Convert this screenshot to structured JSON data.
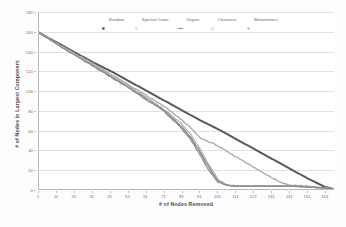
{
  "chart_data": {
    "type": "line",
    "title": "",
    "xlabel": "# of Nodes Removed",
    "ylabel": "# of Nodes in Largest Component",
    "xlim": [
      1,
      166
    ],
    "ylim": [
      0,
      180
    ],
    "ytick_step": 20,
    "xtick_step": 10,
    "grid": true,
    "legend_position": "top-center",
    "yticks": [
      "0",
      "20",
      "40",
      "60",
      "80",
      "100",
      "120",
      "140",
      "160",
      "180"
    ],
    "ytick_values": [
      0,
      20,
      40,
      60,
      80,
      100,
      120,
      140,
      160,
      180
    ],
    "xticks": [
      "1",
      "11",
      "21",
      "31",
      "41",
      "51",
      "61",
      "71",
      "81",
      "91",
      "101",
      "111",
      "121",
      "131",
      "141",
      "151",
      "161"
    ],
    "xtick_values": [
      1,
      11,
      21,
      31,
      41,
      51,
      61,
      71,
      81,
      91,
      101,
      111,
      121,
      131,
      141,
      151,
      161
    ],
    "colors": {
      "random": "#595959",
      "spectral_count": "#a6a6a6",
      "degree": "#808080",
      "closeness": "#b3b3b3",
      "betweenness": "#8c8c8c"
    },
    "series": [
      {
        "name": "Random",
        "marker": "square",
        "color": "#595959",
        "x": [
          1,
          11,
          21,
          31,
          41,
          51,
          61,
          71,
          81,
          91,
          101,
          111,
          121,
          131,
          141,
          151,
          161,
          166
        ],
        "values": [
          159,
          149,
          139,
          129,
          120,
          110,
          100,
          90,
          80,
          70,
          61,
          51,
          41,
          31,
          21,
          11,
          2,
          0
        ]
      },
      {
        "name": "Spectral Count",
        "marker": "cross",
        "color": "#a6a6a6",
        "x": [
          1,
          11,
          21,
          31,
          41,
          51,
          61,
          71,
          81,
          86,
          91,
          96,
          101,
          106,
          111,
          116,
          121,
          126,
          131,
          136,
          141,
          151,
          161,
          166
        ],
        "values": [
          159,
          148,
          138,
          128,
          117,
          106,
          95,
          84,
          70,
          62,
          52,
          48,
          44,
          38,
          33,
          28,
          22,
          17,
          12,
          7,
          4,
          3,
          1,
          0
        ]
      },
      {
        "name": "Degree",
        "marker": "line-cross",
        "color": "#808080",
        "x": [
          1,
          11,
          21,
          31,
          41,
          51,
          61,
          71,
          81,
          86,
          91,
          96,
          101,
          106,
          111,
          121,
          131,
          141,
          151,
          161,
          166
        ],
        "values": [
          159,
          148,
          137,
          126,
          115,
          104,
          92,
          80,
          63,
          52,
          38,
          22,
          9,
          4,
          3,
          3,
          3,
          3,
          2,
          1,
          0
        ]
      },
      {
        "name": "Closeness",
        "marker": "circle",
        "color": "#b3b3b3",
        "x": [
          1,
          11,
          21,
          31,
          41,
          51,
          61,
          71,
          81,
          86,
          91,
          96,
          101,
          106,
          111,
          121,
          131,
          141,
          151,
          161,
          166
        ],
        "values": [
          159,
          148,
          137,
          127,
          116,
          105,
          93,
          81,
          66,
          55,
          41,
          25,
          10,
          4,
          3,
          3,
          3,
          3,
          2,
          1,
          0
        ]
      },
      {
        "name": "Betweenness",
        "marker": "plus",
        "color": "#8c8c8c",
        "x": [
          1,
          11,
          21,
          31,
          41,
          51,
          61,
          71,
          81,
          86,
          91,
          96,
          101,
          106,
          111,
          121,
          131,
          141,
          151,
          161,
          166
        ],
        "values": [
          159,
          147,
          136,
          125,
          114,
          103,
          91,
          79,
          61,
          50,
          35,
          19,
          7,
          4,
          3,
          3,
          3,
          3,
          2,
          1,
          0
        ]
      }
    ]
  },
  "legend": {
    "items": [
      {
        "label": "Random",
        "marker": "square-marker",
        "color": "#595959"
      },
      {
        "label": "Spectral Count",
        "marker": "cross-marker",
        "color": "#a6a6a6"
      },
      {
        "label": "Degree",
        "marker": "line-cross-marker",
        "color": "#808080"
      },
      {
        "label": "Closeness",
        "marker": "circle-marker",
        "color": "#b3b3b3"
      },
      {
        "label": "Betweenness",
        "marker": "plus-marker",
        "color": "#8c8c8c"
      }
    ]
  }
}
